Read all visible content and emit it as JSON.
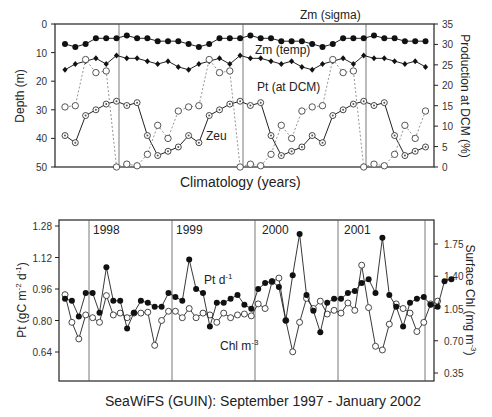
{
  "chart_data": [
    {
      "type": "line",
      "title": "",
      "xlabel": "Climatology (years)",
      "ylabel": "Depth (m)",
      "ylabel_right": "Production at DCM (%)",
      "ylim": [
        50,
        0
      ],
      "ylim_right": [
        0,
        35
      ],
      "yticks": [
        "0",
        "10",
        "20",
        "30",
        "40",
        "50"
      ],
      "yticks_right": [
        "0",
        "5",
        "10",
        "15",
        "20",
        "25",
        "30",
        "35"
      ],
      "grid": false,
      "x": [
        1,
        2,
        3,
        4,
        5,
        6,
        7,
        8,
        9,
        10,
        11,
        12,
        13,
        14,
        15,
        16,
        17,
        18,
        19,
        20,
        21,
        22,
        23,
        24,
        25,
        26,
        27,
        28,
        29,
        30,
        31,
        32,
        33,
        34,
        35,
        36
      ],
      "year_dividers_after_index": [
        6,
        18,
        30
      ],
      "series": [
        {
          "name": "Zm (sigma)",
          "axis": "left",
          "marker": "filled-circle",
          "line": "solid",
          "values": [
            7,
            8,
            7,
            5,
            5,
            5,
            4,
            5,
            5,
            6,
            6,
            6,
            7,
            8,
            7,
            5,
            5,
            5,
            4,
            5,
            5,
            6,
            6,
            6,
            7,
            8,
            7,
            5,
            5,
            5,
            4,
            5,
            5,
            6,
            6,
            6
          ]
        },
        {
          "name": "Zm (temp)",
          "axis": "left",
          "marker": "filled-diamond",
          "line": "solid",
          "values": [
            16,
            14,
            13,
            12,
            14,
            11,
            12,
            12,
            13,
            14,
            13,
            15,
            16,
            14,
            13,
            12,
            14,
            11,
            12,
            12,
            13,
            14,
            13,
            15,
            16,
            14,
            13,
            12,
            14,
            11,
            12,
            12,
            13,
            14,
            13,
            15
          ]
        },
        {
          "name": "Zeu",
          "axis": "left",
          "marker": "open-circle-dot",
          "line": "solid",
          "values": [
            39,
            41.5,
            32,
            30,
            28,
            27,
            28.5,
            27.5,
            39,
            46,
            44.5,
            43,
            39,
            41.5,
            32,
            30,
            28,
            27,
            28.5,
            27.5,
            39,
            46,
            44.5,
            43,
            39,
            41.5,
            32,
            30,
            28,
            27,
            28.5,
            27.5,
            39,
            46,
            44.5,
            43
          ]
        },
        {
          "name": "Pt (at DCM)",
          "axis": "right",
          "marker": "open-circle",
          "line": "dotted",
          "values": [
            14.7,
            15,
            26.3,
            23.1,
            23.5,
            0,
            0.7,
            0.3,
            3.1,
            10.2,
            7,
            13.7,
            14.7,
            15,
            26.3,
            23.1,
            23.5,
            0,
            0.7,
            0.3,
            3.1,
            10.2,
            7,
            13.7,
            14.7,
            15,
            26.3,
            23.1,
            23.5,
            0,
            0.7,
            0.3,
            3.1,
            10.2,
            7,
            13.7
          ]
        }
      ],
      "annotations": [
        "Zm (sigma)",
        "Zm (temp)",
        "Pt  (at DCM)",
        "Zeu"
      ]
    },
    {
      "type": "line",
      "title": "",
      "xlabel": "SeaWiFS (GUIN): September 1997 - January 2002",
      "ylabel": "Pt (gC m-2 d-1)",
      "ylabel_right": "Surface Chl (mg m-3)",
      "ylim": [
        0.56,
        1.32
      ],
      "ylim_right": [
        0.3,
        1.85
      ],
      "yticks": [
        "0.64",
        "0.80",
        "0.96",
        "1.12",
        "1.28"
      ],
      "yticks_right": [
        "0.35",
        "0.70",
        "1.05",
        "1.40",
        "1.75"
      ],
      "year_labels": [
        "1998",
        "1999",
        "2000",
        "2001"
      ],
      "grid": false,
      "series": [
        {
          "name": "Pt d-1",
          "axis": "left",
          "marker": "filled-circle",
          "values": [
            0.91,
            0.9,
            0.82,
            0.94,
            0.94,
            0.84,
            1.07,
            0.9,
            0.9,
            0.76,
            0.84,
            0.9,
            0.89,
            0.87,
            0.87,
            0.94,
            0.92,
            0.9,
            1.11,
            0.96,
            0.94,
            0.77,
            0.89,
            0.89,
            0.91,
            0.93,
            0.88,
            0.86,
            0.96,
            0.99,
            1.0,
            0.97,
            0.8,
            1.03,
            1.24,
            0.93,
            0.85,
            0.74,
            0.89,
            0.91,
            0.91,
            0.94,
            0.95,
            0.99,
            1.01,
            0.94,
            1.22,
            0.93,
            0.87,
            0.77,
            0.89,
            0.91,
            0.92,
            0.88,
            0.87,
            1.0,
            1.01
          ]
        },
        {
          "name": "Chl m-3",
          "axis": "right",
          "marker": "open-circle",
          "values": [
            1.2,
            0.9,
            0.72,
            0.98,
            0.95,
            0.9,
            1.19,
            0.98,
            1.0,
            0.95,
            1.0,
            1.0,
            1.01,
            0.65,
            0.92,
            1.02,
            1.02,
            0.95,
            1.05,
            0.95,
            1.0,
            0.98,
            0.9,
            1.0,
            0.95,
            0.98,
            0.99,
            0.97,
            1.1,
            1.05,
            1.34,
            1.38,
            0.92,
            0.58,
            0.9,
            1.16,
            1.05,
            1.13,
            0.99,
            1.03,
            1.0,
            1.11,
            1.03,
            1.52,
            1.06,
            0.64,
            0.6,
            0.88,
            1.1,
            1.05,
            1.0,
            0.8,
            0.9,
            1.1,
            1.13
          ]
        }
      ],
      "annotations": [
        "Pt d-1",
        "Chl m-3"
      ]
    }
  ],
  "top": {
    "labels": {
      "zm_sigma": "Zm (sigma)",
      "zm_temp": "Zm (temp)",
      "pt": "Pt  (at DCM)",
      "zeu": "Zeu",
      "xlabel": "Climatology (years)",
      "ylabel": "Depth (m)",
      "ylabel_right": "Production  at DCM (%)"
    },
    "yticks": [
      "0",
      "10",
      "20",
      "30",
      "40",
      "50"
    ],
    "yticks_right": [
      "0",
      "5",
      "10",
      "15",
      "20",
      "25",
      "30",
      "35"
    ]
  },
  "bottom": {
    "labels": {
      "pt": "Pt d",
      "pt_sup": "-1",
      "chl": "Chl m",
      "chl_sup": "-3",
      "xlabel": "SeaWiFS (GUIN): September 1997 - January 2002",
      "ylabel": "Pt (gC m  d  )",
      "ylabel_right": "Surface Chl (mg m  )"
    },
    "years": [
      "1998",
      "1999",
      "2000",
      "2001"
    ],
    "yticks": [
      "1.28",
      "1.12",
      "0.96",
      "0.80",
      "0.64"
    ],
    "yticks_right": [
      "1.75",
      "1.40",
      "1.05",
      "0.70",
      "0.35"
    ]
  }
}
